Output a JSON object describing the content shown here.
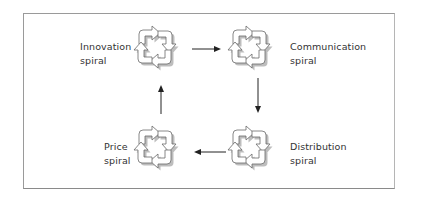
{
  "diagram": {
    "nodes": [
      {
        "id": "innovation",
        "line1": "Innovation",
        "line2": "spiral"
      },
      {
        "id": "communication",
        "line1": "Communication",
        "line2": "spiral"
      },
      {
        "id": "distribution",
        "line1": "Distribution",
        "line2": "spiral"
      },
      {
        "id": "price",
        "line1": "Price",
        "line2": "spiral"
      }
    ],
    "edges": [
      {
        "from": "innovation",
        "to": "communication"
      },
      {
        "from": "communication",
        "to": "distribution"
      },
      {
        "from": "distribution",
        "to": "price"
      },
      {
        "from": "price",
        "to": "innovation"
      }
    ],
    "icon": "cycle-arrows-icon",
    "colors": {
      "border": "#9a9a9a",
      "arrow": "#222222",
      "text": "#333333",
      "icon_shadow": "#9e9e9e"
    }
  }
}
